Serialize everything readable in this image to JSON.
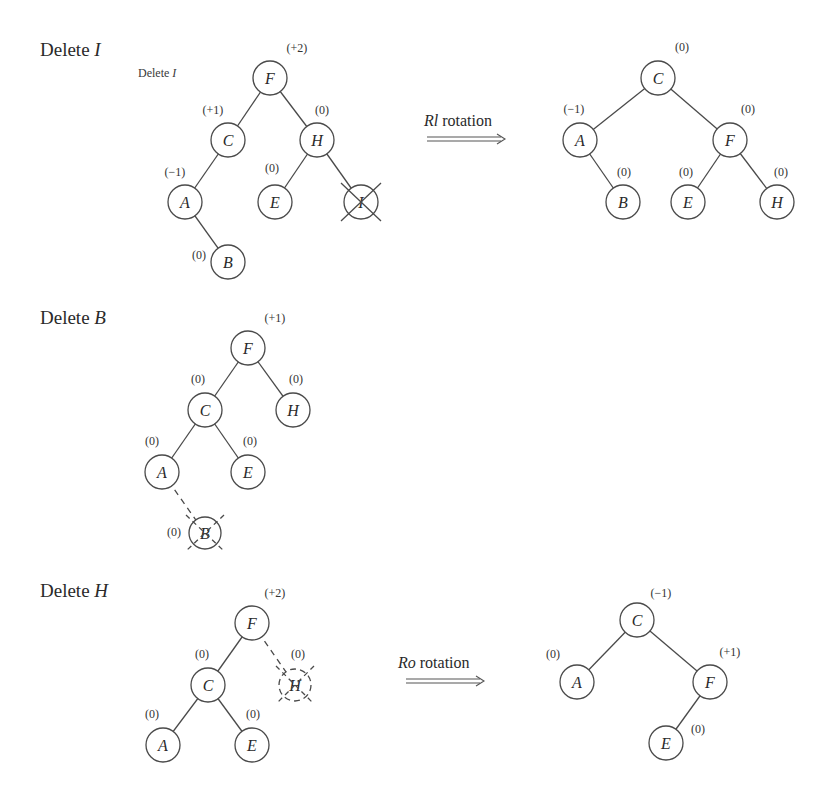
{
  "sections": [
    {
      "title": "Delete",
      "title_var": "I",
      "subtitle": "Delete",
      "subtitle_var": "I",
      "before_tree": {
        "nodes": [
          {
            "id": "F",
            "label": "F",
            "bf": "(+2)"
          },
          {
            "id": "C",
            "label": "C",
            "bf": "(+1)"
          },
          {
            "id": "H",
            "label": "H",
            "bf": "(0)"
          },
          {
            "id": "A",
            "label": "A",
            "bf": "(−1)"
          },
          {
            "id": "E",
            "label": "E",
            "bf": "(0)"
          },
          {
            "id": "I",
            "label": "I",
            "bf": "",
            "deleted": true
          },
          {
            "id": "B",
            "label": "B",
            "bf": "(0)"
          }
        ]
      },
      "rotation": {
        "name": "Rl",
        "word": "rotation"
      },
      "after_tree": {
        "nodes": [
          {
            "id": "C",
            "label": "C",
            "bf": "(0)"
          },
          {
            "id": "A",
            "label": "A",
            "bf": "(−1)"
          },
          {
            "id": "F",
            "label": "F",
            "bf": "(0)"
          },
          {
            "id": "B",
            "label": "B",
            "bf": "(0)"
          },
          {
            "id": "E",
            "label": "E",
            "bf": "(0)"
          },
          {
            "id": "H",
            "label": "H",
            "bf": "(0)"
          }
        ]
      }
    },
    {
      "title": "Delete",
      "title_var": "B",
      "before_tree": {
        "nodes": [
          {
            "id": "F",
            "label": "F",
            "bf": "(+1)"
          },
          {
            "id": "C",
            "label": "C",
            "bf": "(0)"
          },
          {
            "id": "H",
            "label": "H",
            "bf": "(0)"
          },
          {
            "id": "A",
            "label": "A",
            "bf": "(0)"
          },
          {
            "id": "E",
            "label": "E",
            "bf": "(0)"
          },
          {
            "id": "B",
            "label": "B",
            "bf": "(0)",
            "deleted": true
          }
        ]
      }
    },
    {
      "title": "Delete",
      "title_var": "H",
      "before_tree": {
        "nodes": [
          {
            "id": "F",
            "label": "F",
            "bf": "(+2)"
          },
          {
            "id": "C",
            "label": "C",
            "bf": "(0)"
          },
          {
            "id": "H",
            "label": "H",
            "bf": "(0)",
            "deleted": true
          },
          {
            "id": "A",
            "label": "A",
            "bf": "(0)"
          },
          {
            "id": "E",
            "label": "E",
            "bf": "(0)"
          }
        ]
      },
      "rotation": {
        "name": "Ro",
        "word": "rotation"
      },
      "after_tree": {
        "nodes": [
          {
            "id": "C",
            "label": "C",
            "bf": "(−1)"
          },
          {
            "id": "A",
            "label": "A",
            "bf": "(0)"
          },
          {
            "id": "F",
            "label": "F",
            "bf": "(+1)"
          },
          {
            "id": "E",
            "label": "E",
            "bf": "(0)"
          }
        ]
      }
    }
  ]
}
